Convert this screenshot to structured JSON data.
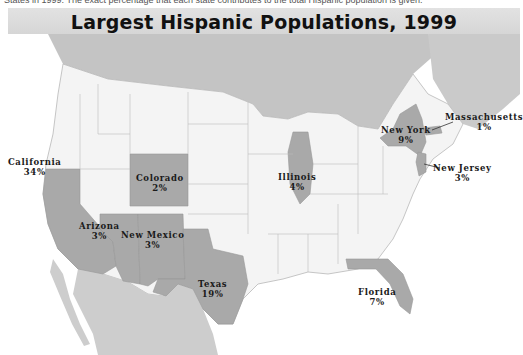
{
  "caption_fragment": "States in 1999. The exact percentage that each state contributes to the total Hispanic population is given.",
  "title": "Largest Hispanic Populations, 1999",
  "colors": {
    "highlighted_state": "#a9a9a9",
    "other_state": "#f4f4f4",
    "canada": "#c4c4c4",
    "mexico": "#cdcdcd",
    "water": "#ffffff",
    "border": "#b8b8b8",
    "title_bar": "#dcdcdc"
  },
  "states": [
    {
      "name": "California",
      "pct": "34%"
    },
    {
      "name": "Texas",
      "pct": "19%"
    },
    {
      "name": "New York",
      "pct": "9%"
    },
    {
      "name": "Florida",
      "pct": "7%"
    },
    {
      "name": "Illinois",
      "pct": "4%"
    },
    {
      "name": "Arizona",
      "pct": "3%"
    },
    {
      "name": "New Mexico",
      "pct": "3%"
    },
    {
      "name": "New Jersey",
      "pct": "3%"
    },
    {
      "name": "Colorado",
      "pct": "2%"
    },
    {
      "name": "Massachusetts",
      "pct": "1%"
    }
  ]
}
